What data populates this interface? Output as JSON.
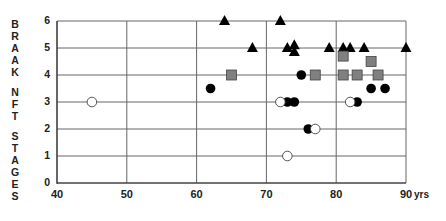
{
  "chart_data": {
    "type": "scatter",
    "title": "",
    "xlabel": "yrs",
    "ylabel": "BRAAK NFT STAGES",
    "xlim": [
      40,
      90
    ],
    "ylim": [
      0,
      6
    ],
    "xticks": [
      "40",
      "50",
      "60",
      "70",
      "80",
      "90"
    ],
    "yticks": [
      "0",
      "1",
      "2",
      "3",
      "4",
      "5",
      "6"
    ],
    "grid": true,
    "legend": null,
    "series": [
      {
        "name": "filled-triangle",
        "marker": "triangle",
        "color": "#000000",
        "points": [
          [
            64,
            6
          ],
          [
            72,
            6
          ],
          [
            68,
            5
          ],
          [
            73,
            5
          ],
          [
            74,
            5.1
          ],
          [
            74,
            4.85
          ],
          [
            79,
            5
          ],
          [
            81,
            5
          ],
          [
            82,
            5
          ],
          [
            84,
            5
          ],
          [
            90,
            5
          ]
        ]
      },
      {
        "name": "gray-square",
        "marker": "square",
        "color": "#808080",
        "points": [
          [
            65,
            4
          ],
          [
            77,
            4
          ],
          [
            81,
            4
          ],
          [
            83,
            4
          ],
          [
            86,
            4
          ],
          [
            81,
            4.7
          ],
          [
            85,
            4.5
          ]
        ]
      },
      {
        "name": "filled-circle",
        "marker": "circle-filled",
        "color": "#000000",
        "points": [
          [
            62,
            3.5
          ],
          [
            75,
            4
          ],
          [
            73,
            3
          ],
          [
            74,
            3
          ],
          [
            83,
            3
          ],
          [
            85,
            3.5
          ],
          [
            87,
            3.5
          ],
          [
            76,
            2
          ]
        ]
      },
      {
        "name": "open-circle",
        "marker": "circle-open",
        "color": "#ffffff",
        "points": [
          [
            45,
            3
          ],
          [
            72,
            3
          ],
          [
            82,
            3
          ],
          [
            77,
            2
          ],
          [
            73,
            1
          ]
        ]
      }
    ]
  },
  "axis": {
    "ylabel_letters": [
      "B",
      "R",
      "A",
      "A",
      "K",
      "",
      "N",
      "F",
      "T",
      "",
      "S",
      "T",
      "A",
      "G",
      "E",
      "S"
    ],
    "x_unit": "yrs"
  }
}
